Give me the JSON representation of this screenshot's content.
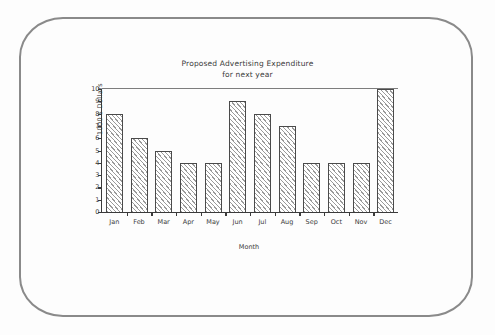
{
  "chart_data": {
    "type": "bar",
    "title": "Proposed Advertising Expenditure",
    "subtitle": "for next year",
    "title_lines": [
      "Proposed Advertising Expenditure",
      "for next year"
    ],
    "xlabel": "Month",
    "ylabel": "1000's Dollars",
    "categories": [
      "Jan",
      "Feb",
      "Mar",
      "Apr",
      "May",
      "Jun",
      "Jul",
      "Aug",
      "Sep",
      "Oct",
      "Nov",
      "Dec"
    ],
    "values": [
      8,
      6,
      5,
      4,
      4,
      9,
      8,
      7,
      4,
      4,
      4,
      10
    ],
    "ylim": [
      0,
      10
    ],
    "ytick_labels": [
      "0",
      "1",
      "2",
      "3",
      "4",
      "5",
      "6",
      "7",
      "8",
      "9",
      "10"
    ],
    "ytick_values": [
      0,
      1,
      2,
      3,
      4,
      5,
      6,
      7,
      8,
      9,
      10
    ],
    "grid": false,
    "legend": null,
    "bar_fill": "#ffffff",
    "bar_hatch": "diagonal-lines",
    "bar_hatch_color": "#9a9a9a",
    "bar_outline_color": "#4a4a4a",
    "axis_color": "#3a3a3a",
    "text_color": "#3b3b3b"
  },
  "frame": {
    "border_color": "#8a8a8a",
    "background": "#fdfdfd"
  }
}
